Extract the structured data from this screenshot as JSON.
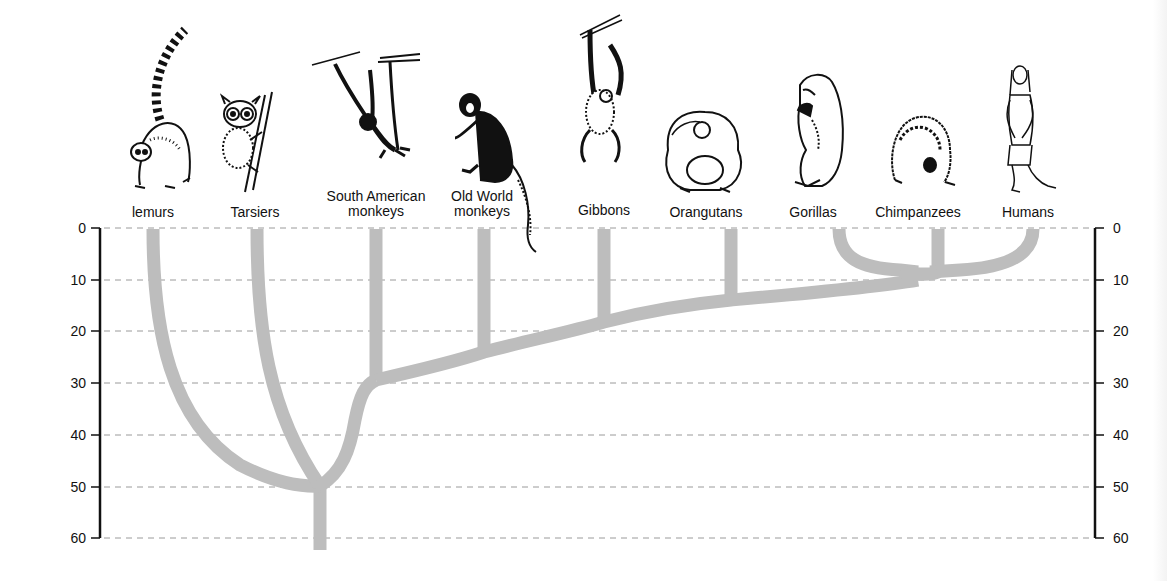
{
  "diagram": {
    "type": "phylogenetic-tree",
    "axis": {
      "unit_hint": "millions of years ago",
      "ticks": [
        0,
        10,
        20,
        30,
        40,
        50,
        60
      ],
      "left_labels": [
        "0",
        "10",
        "20",
        "30",
        "40",
        "50",
        "60"
      ],
      "right_labels": [
        "0",
        "10",
        "20",
        "30",
        "40",
        "50",
        "60"
      ]
    },
    "colors": {
      "branch": "#bdbdbd",
      "axis": "#111111",
      "gridline": "#9a9a9a",
      "text": "#111111"
    },
    "taxa": [
      {
        "id": "lemurs",
        "label": "lemurs",
        "x": 153,
        "divergence": 50
      },
      {
        "id": "tarsiers",
        "label": "Tarsiers",
        "x": 255,
        "divergence": 50
      },
      {
        "id": "south-american-monkeys",
        "label": "South American\nmonkeys",
        "x": 376,
        "divergence": 30
      },
      {
        "id": "old-world-monkeys",
        "label": "Old World\nmonkeys",
        "x": 484,
        "divergence": 25
      },
      {
        "id": "gibbons",
        "label": "Gibbons",
        "x": 604,
        "divergence": 18
      },
      {
        "id": "orangutans",
        "label": "Orangutans",
        "x": 731,
        "divergence": 14
      },
      {
        "id": "gorillas",
        "label": "Gorillas",
        "x": 813,
        "divergence": 10
      },
      {
        "id": "chimpanzees",
        "label": "Chimpanzees",
        "x": 918,
        "divergence": 8
      },
      {
        "id": "humans",
        "label": "Humans",
        "x": 1028,
        "divergence": 8
      }
    ],
    "root": {
      "x": 320,
      "time": 50,
      "extends_to": 63
    }
  }
}
